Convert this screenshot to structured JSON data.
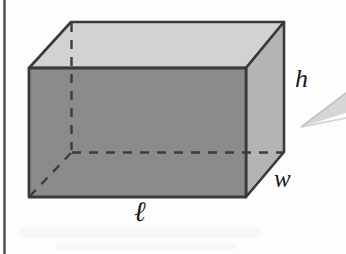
{
  "figure": {
    "name": "rectangular-prism-diagram",
    "labels": {
      "height": "h",
      "width": "w",
      "length": "ℓ"
    },
    "colors": {
      "top_face": "#d2d2d2",
      "front_face": "#8b8b8b",
      "right_face": "#b4b4b4",
      "edge_stroke": "#3a3a3a",
      "hidden_edge_stroke": "#404040",
      "margin_rule": "#4a4a4a",
      "pointer_wedge": "#cfcfcf",
      "background": "#fdfdfd"
    },
    "geometry": {
      "front_top_left": [
        29,
        68
      ],
      "front_top_right": [
        246,
        68
      ],
      "front_bottom_right": [
        246,
        197
      ],
      "front_bottom_left": [
        29,
        197
      ],
      "back_top_left": [
        71,
        22
      ],
      "back_top_right": [
        284,
        22
      ],
      "back_bottom_right": [
        284,
        152
      ],
      "back_bottom_left": [
        71,
        152
      ]
    },
    "hidden_edges": [
      "back-top-left to back-bottom-left",
      "back-bottom-left to back-bottom-right",
      "back-bottom-left to front-bottom-left"
    ],
    "margin_rule": {
      "x": 4,
      "y_top": 0,
      "y_bottom": 254
    },
    "pointer_wedge": {
      "apex": [
        301,
        127
      ],
      "upper_end": [
        346,
        94
      ],
      "lower_end": [
        346,
        114
      ]
    }
  }
}
